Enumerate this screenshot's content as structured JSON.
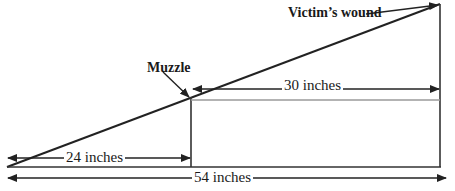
{
  "diagram": {
    "type": "trajectory-geometry",
    "labels": {
      "muzzle": "Muzzle",
      "victims_wound": "Victim’s wound",
      "segment_muzzle_to_wound": "30 inches",
      "segment_origin_to_muzzle": "24 inches",
      "segment_total": "54 inches"
    },
    "measurements": {
      "origin_to_muzzle_inches": 24,
      "muzzle_to_wound_inches": 30,
      "total_inches": 54
    },
    "colors": {
      "line": "#222222",
      "reference_line": "#9a9a9a",
      "text": "#1a1a1a",
      "background": "#ffffff"
    }
  }
}
